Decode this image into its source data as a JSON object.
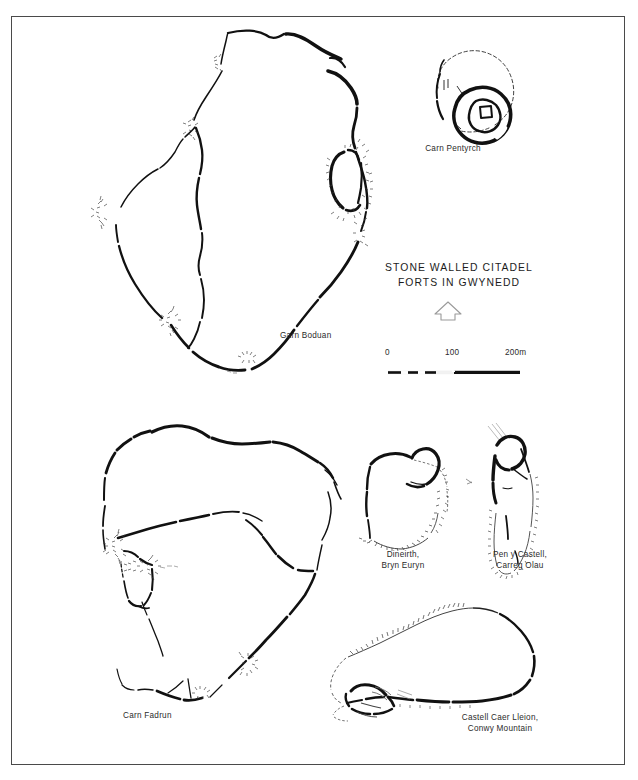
{
  "figure": {
    "title_lines": [
      "STONE WALLED CITADEL",
      "FORTS IN GWYNEDD"
    ],
    "background_color": "#ffffff",
    "ink_color": "#111111",
    "frame_color": "#4a4a4a",
    "north_arrow_icon": "north-arrow-icon"
  },
  "scale_bar": {
    "labels": [
      "0",
      "100",
      "200m"
    ],
    "unit": "m",
    "max_value": 200,
    "tick_values": [
      0,
      100,
      200
    ],
    "segment_style": "alternating-black-white-then-solid"
  },
  "plans": [
    {
      "id": "garn-boduan",
      "label": "Garn Boduan",
      "label_lines": [
        "Garn Boduan"
      ]
    },
    {
      "id": "carn-pentyrch",
      "label": "Carn Pentyrch",
      "label_lines": [
        "Carn Pentyrch"
      ]
    },
    {
      "id": "carn-fadrun",
      "label": "Carn Fadrun",
      "label_lines": [
        "Carn Fadrun"
      ]
    },
    {
      "id": "dineirth-bryn-euryn",
      "label": "Dineirth, Bryn Euryn",
      "label_lines": [
        "Dineirth,",
        "Bryn Euryn"
      ]
    },
    {
      "id": "pen-y-castell-carreg-olau",
      "label": "Pen y Castell, Carreg Olau",
      "label_lines": [
        "Pen y Castell,",
        "Carreg Olau"
      ]
    },
    {
      "id": "castell-caer-lleion-conwy-mountain",
      "label": "Castell Caer Lleion, Conwy Mountain",
      "label_lines": [
        "Castell Caer Lleion,",
        "Conwy Mountain"
      ]
    }
  ]
}
